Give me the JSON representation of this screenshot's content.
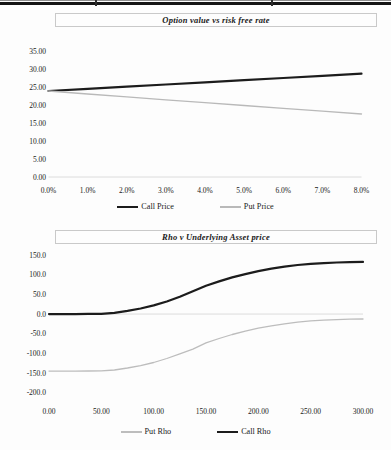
{
  "page": {
    "text_color": "#1a1a1a",
    "rule_color": "#141414"
  },
  "chart_data": [
    {
      "type": "line",
      "title": "Option value vs risk free rate",
      "xlabel": "",
      "ylabel": "",
      "grid": false,
      "legend_position": "bottom",
      "x_range": [
        0,
        8
      ],
      "y_range": [
        0,
        35
      ],
      "x_tick_labels": [
        "0.0%",
        "1.0%",
        "2.0%",
        "3.0%",
        "4.0%",
        "5.0%",
        "6.0%",
        "7.0%",
        "8.0%"
      ],
      "y_tick_labels": [
        "35.00",
        "30.00",
        "25.00",
        "20.00",
        "15.00",
        "10.00",
        "5.00",
        "0.00"
      ],
      "series": [
        {
          "name": "Call Price",
          "color": "#1c1c1c",
          "weight": 2.2,
          "x": [
            0,
            1,
            2,
            3,
            4,
            5,
            6,
            7,
            8
          ],
          "values": [
            23.9,
            24.5,
            25.1,
            25.7,
            26.3,
            26.9,
            27.5,
            28.1,
            28.7
          ]
        },
        {
          "name": "Put Price",
          "color": "#b9b9b9",
          "weight": 1.3,
          "x": [
            0,
            1,
            2,
            3,
            4,
            5,
            6,
            7,
            8
          ],
          "values": [
            23.9,
            23.05,
            22.25,
            21.45,
            20.65,
            19.85,
            19.05,
            18.3,
            17.5
          ]
        }
      ],
      "legend": [
        {
          "label": "Call Price",
          "color": "#1c1c1c",
          "weight": 2.4
        },
        {
          "label": "Put Price",
          "color": "#b9b9b9",
          "weight": 1.3
        }
      ]
    },
    {
      "type": "line",
      "title": "Rho v Underlying Asset price",
      "xlabel": "",
      "ylabel": "",
      "grid": false,
      "legend_position": "bottom",
      "x_range": [
        0,
        300
      ],
      "y_range": [
        -200,
        150
      ],
      "x_tick_labels": [
        "0.00",
        "50.00",
        "100.00",
        "150.00",
        "200.00",
        "250.00",
        "300.00"
      ],
      "y_tick_labels": [
        "150.0",
        "100.0",
        "50.0",
        "0.0",
        "-50.0",
        "-100.0",
        "-150.0",
        "-200.0"
      ],
      "series": [
        {
          "name": "Put Rho",
          "color": "#bdbdbd",
          "weight": 1.3,
          "x": [
            0,
            12.5,
            25,
            37.5,
            50,
            62.5,
            75,
            87.5,
            100,
            112.5,
            125,
            137.5,
            150,
            162.5,
            175,
            187.5,
            200,
            212.5,
            225,
            237.5,
            250,
            262.5,
            275,
            287.5,
            300
          ],
          "values": [
            -145,
            -145,
            -145,
            -144.7,
            -144.5,
            -142,
            -137,
            -131,
            -123,
            -113,
            -101,
            -89,
            -73,
            -62,
            -52,
            -43.5,
            -36,
            -30,
            -25,
            -20.5,
            -17.5,
            -15.5,
            -14,
            -13,
            -12.5
          ]
        },
        {
          "name": "Call Rho",
          "color": "#1c1c1c",
          "weight": 2.2,
          "x": [
            0,
            12.5,
            25,
            37.5,
            50,
            62.5,
            75,
            87.5,
            100,
            112.5,
            125,
            137.5,
            150,
            162.5,
            175,
            187.5,
            200,
            212.5,
            225,
            237.5,
            250,
            262.5,
            275,
            287.5,
            300
          ],
          "values": [
            0,
            0,
            0,
            0.3,
            0.5,
            3,
            8,
            14,
            22,
            32,
            44,
            58,
            72,
            83,
            93,
            101.5,
            109,
            115.5,
            120.5,
            124.5,
            127.5,
            129.5,
            131,
            132,
            132.5
          ]
        }
      ],
      "legend": [
        {
          "label": "Put Rho",
          "color": "#bdbdbd",
          "weight": 1.3
        },
        {
          "label": "Call Rho",
          "color": "#1c1c1c",
          "weight": 2.4
        }
      ]
    }
  ]
}
